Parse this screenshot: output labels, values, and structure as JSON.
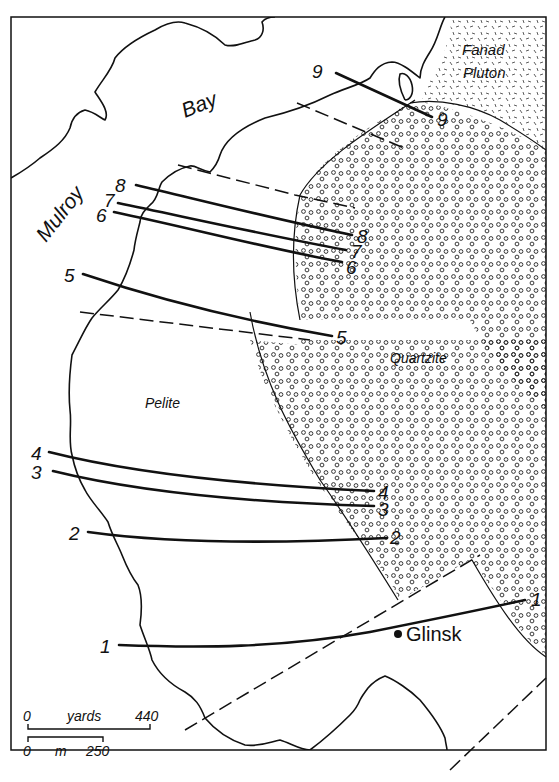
{
  "map": {
    "place_labels": {
      "bay_word1": "Mulroy",
      "bay_word2": "Bay",
      "pluton_line1": "Fanad",
      "pluton_line2": "Pluton",
      "quartzite": "Quartzite",
      "pelite": "Pelite",
      "town": "Glinsk"
    },
    "traverses": [
      {
        "id": "1",
        "start_label": "1",
        "end_label": "1"
      },
      {
        "id": "2",
        "start_label": "2",
        "end_label": "2"
      },
      {
        "id": "3",
        "start_label": "3",
        "end_label": "3"
      },
      {
        "id": "4",
        "start_label": "4",
        "end_label": "4"
      },
      {
        "id": "5",
        "start_label": "5",
        "end_label": "5"
      },
      {
        "id": "6",
        "start_label": "6",
        "end_label": "6"
      },
      {
        "id": "7",
        "start_label": "7",
        "end_label": "7"
      },
      {
        "id": "8",
        "start_label": "8",
        "end_label": "8"
      },
      {
        "id": "9",
        "start_label": "9",
        "end_label": "9"
      }
    ],
    "scale_bars": {
      "yards": {
        "zero": "0",
        "unit": "yards",
        "max": "440"
      },
      "meters": {
        "zero": "0",
        "unit": "m",
        "max": "250"
      }
    },
    "colors": {
      "ink": "#111111",
      "paper": "#ffffff"
    }
  }
}
